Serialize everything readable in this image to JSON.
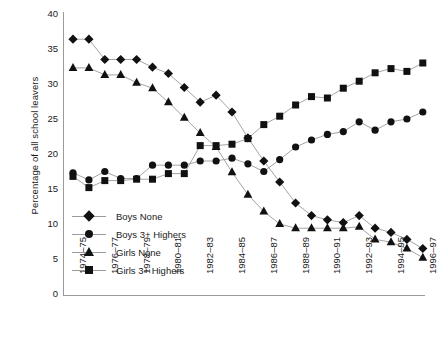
{
  "chart_data": {
    "type": "line",
    "title": "",
    "xlabel": "",
    "ylabel": "Percentage of all school leavers",
    "ylim": [
      0,
      40
    ],
    "yticks": [
      0,
      5,
      10,
      15,
      20,
      25,
      30,
      35,
      40
    ],
    "grid": false,
    "legend_position": "inside-lower-left",
    "categories": [
      "1974–75",
      "1975–76",
      "1976–77",
      "1977–78",
      "1978–79",
      "1979–80",
      "1980–81",
      "1981–82",
      "1982–83",
      "1983–84",
      "1984–85",
      "1985–86",
      "1986–87",
      "1987–88",
      "1988–89",
      "1989–90",
      "1990–91",
      "1991–92",
      "1992–93",
      "1993–94",
      "1994–95",
      "1995–96",
      "1996–97"
    ],
    "xtick_labels": [
      "1974–75",
      "1976–77",
      "1978–79",
      "1980–81",
      "1982–83",
      "1984–85",
      "1986–87",
      "1988–89",
      "1990–91",
      "1992–93",
      "1994–95",
      "1996–97"
    ],
    "xtick_indices": [
      0,
      2,
      4,
      6,
      8,
      10,
      12,
      14,
      16,
      18,
      20,
      22
    ],
    "series": [
      {
        "name": "Boys None",
        "marker": "diamond",
        "color": "#111111",
        "values": [
          36.4,
          36.4,
          33.5,
          33.5,
          33.5,
          32.4,
          31.5,
          29.5,
          27.4,
          28.4,
          26.0,
          22.3,
          19.0,
          16.0,
          13.0,
          11.2,
          10.6,
          10.2,
          11.2,
          9.4,
          8.8,
          7.8,
          6.5
        ]
      },
      {
        "name": "Boys 3+ Highers",
        "marker": "circle",
        "color": "#111111",
        "values": [
          17.3,
          16.3,
          17.5,
          16.5,
          16.5,
          18.4,
          18.4,
          18.4,
          19.0,
          19.0,
          19.4,
          18.6,
          17.5,
          19.2,
          21.0,
          22.0,
          22.8,
          23.2,
          24.6,
          23.4,
          24.6,
          25.0,
          26.0
        ]
      },
      {
        "name": "Girls None",
        "marker": "triangle",
        "color": "#111111",
        "values": [
          32.3,
          32.3,
          31.3,
          31.3,
          30.2,
          29.4,
          27.4,
          25.2,
          23.0,
          21.0,
          17.4,
          14.2,
          11.8,
          10.0,
          9.4,
          9.4,
          9.4,
          9.4,
          9.6,
          7.8,
          7.4,
          6.5,
          5.2
        ]
      },
      {
        "name": "Girls 3+ Highers",
        "marker": "square",
        "color": "#111111",
        "values": [
          16.8,
          15.2,
          16.2,
          16.2,
          16.4,
          16.4,
          17.2,
          17.2,
          21.2,
          21.2,
          21.4,
          22.2,
          24.2,
          25.4,
          27.0,
          28.2,
          28.0,
          29.4,
          30.4,
          31.6,
          32.2,
          31.8,
          33.0
        ]
      }
    ]
  },
  "legend": {
    "items": [
      {
        "label": "Boys None",
        "marker": "diamond"
      },
      {
        "label": "Boys 3+ Highers",
        "marker": "circle"
      },
      {
        "label": "Girls None",
        "marker": "triangle"
      },
      {
        "label": "Girls 3+ Highers",
        "marker": "square"
      }
    ]
  },
  "axis": {
    "y_title": "Percentage of all school leavers",
    "y_tick_labels": [
      "40",
      "35",
      "30",
      "25",
      "20",
      "15",
      "10",
      "5",
      "0"
    ],
    "axis_color": "#9a9a9a",
    "line_color": "#9a9a9a",
    "marker_color": "#111111"
  }
}
